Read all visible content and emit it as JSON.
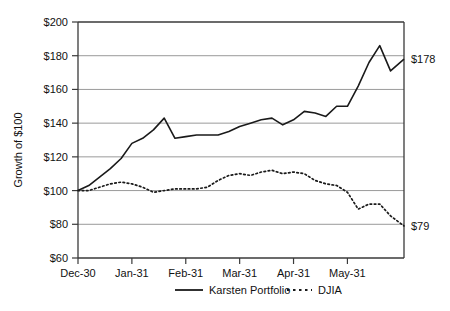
{
  "chart_data": {
    "type": "line",
    "title": "",
    "xlabel": "",
    "ylabel": "Growth of $100",
    "ylim": [
      60,
      200
    ],
    "ytick_labels": [
      "$200",
      "$180",
      "$160",
      "$140",
      "$120",
      "$100",
      "$80",
      "$60"
    ],
    "ytick_values": [
      200,
      180,
      160,
      140,
      120,
      100,
      80,
      60
    ],
    "categories": [
      "Dec-30",
      "Jan-31",
      "Feb-31",
      "Mar-31",
      "Apr-31",
      "May-31"
    ],
    "xtick_labels": [
      "Dec-30",
      "Jan-31",
      "Feb-31",
      "Mar-31",
      "Apr-31",
      "May-31"
    ],
    "grid": "horizontal",
    "legend_position": "bottom",
    "x_start": 0,
    "x_end": 6.05,
    "series": [
      {
        "name": "Karsten Portfolio",
        "style": "solid",
        "color": "#1a1a1a",
        "end_label": "$178",
        "end_value": 178,
        "x": [
          0.0,
          0.2,
          0.4,
          0.6,
          0.8,
          1.0,
          1.2,
          1.4,
          1.6,
          1.8,
          2.0,
          2.2,
          2.4,
          2.6,
          2.8,
          3.0,
          3.2,
          3.4,
          3.6,
          3.8,
          4.0,
          4.2,
          4.4,
          4.6,
          4.8,
          5.0,
          5.2,
          5.4,
          5.6,
          5.8,
          6.05
        ],
        "values": [
          100,
          103,
          108,
          113,
          119,
          128,
          131,
          136,
          143,
          131,
          132,
          133,
          133,
          133,
          135,
          138,
          140,
          142,
          143,
          139,
          142,
          147,
          146,
          144,
          150,
          150,
          162,
          176,
          186,
          171,
          178
        ]
      },
      {
        "name": "DJIA",
        "style": "dotted",
        "color": "#1a1a1a",
        "end_label": "$79",
        "end_value": 79,
        "x": [
          0.0,
          0.2,
          0.4,
          0.6,
          0.8,
          1.0,
          1.2,
          1.4,
          1.6,
          1.8,
          2.0,
          2.2,
          2.4,
          2.6,
          2.8,
          3.0,
          3.2,
          3.4,
          3.6,
          3.8,
          4.0,
          4.2,
          4.4,
          4.6,
          4.8,
          5.0,
          5.2,
          5.4,
          5.6,
          5.8,
          6.05
        ],
        "values": [
          100,
          100,
          102,
          104,
          105,
          104,
          102,
          99,
          100,
          101,
          101,
          101,
          102,
          106,
          109,
          110,
          109,
          111,
          112,
          110,
          111,
          110,
          106,
          104,
          103,
          99,
          89,
          92,
          92,
          85,
          79
        ]
      }
    ]
  },
  "legend": {
    "items": [
      {
        "label": "Karsten Portfolio",
        "style": "solid"
      },
      {
        "label": "DJIA",
        "style": "dotted"
      }
    ]
  }
}
